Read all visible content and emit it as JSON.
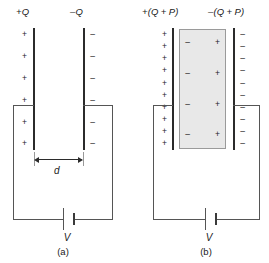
{
  "figure": {
    "type": "physics-diagram"
  },
  "panel_a": {
    "caption": "(a)",
    "left_plate_label": "+Q",
    "right_plate_label": "–Q",
    "left_plate_signs": [
      "+",
      "+",
      "+",
      "+",
      "+",
      "+"
    ],
    "right_plate_signs": [
      "–",
      "–",
      "–",
      "–",
      "–",
      "–"
    ],
    "separation_label": "d",
    "battery_label": "V"
  },
  "panel_b": {
    "caption": "(b)",
    "left_plate_label": "+(Q + P)",
    "right_plate_label": "–(Q + P)",
    "left_plate_signs": [
      "+",
      "+",
      "+",
      "+",
      "+",
      "+",
      "+",
      "+",
      "+",
      "+"
    ],
    "right_plate_signs": [
      "–",
      "–",
      "–",
      "–",
      "–",
      "–",
      "–",
      "–",
      "–",
      "–"
    ],
    "dielectric": {
      "left_face_signs": [
        "–",
        "–",
        "–",
        "–"
      ],
      "right_face_signs": [
        "+",
        "+",
        "+",
        "+"
      ],
      "fill_color": "#e8e8e8",
      "border_color": "#9a9a9a"
    },
    "battery_label": "V"
  },
  "colors": {
    "plate": "#2b2b2b",
    "wire": "#555555",
    "text": "#1a1a1a",
    "background": "#ffffff"
  }
}
